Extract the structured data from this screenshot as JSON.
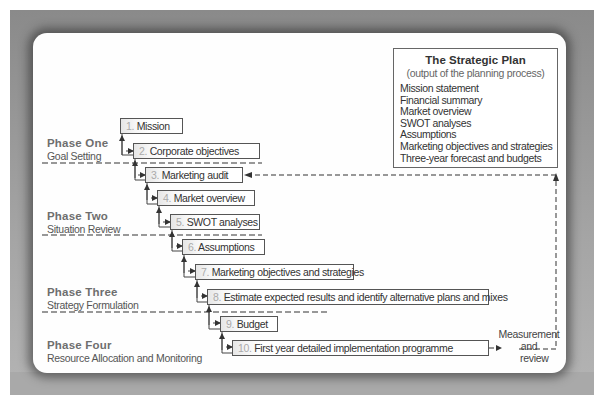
{
  "diagram": {
    "type": "flow-process",
    "steps": [
      {
        "num": "1.",
        "label": "Mission"
      },
      {
        "num": "2.",
        "label": "Corporate objectives"
      },
      {
        "num": "3.",
        "label": "Marketing audit"
      },
      {
        "num": "4.",
        "label": "Market overview"
      },
      {
        "num": "5.",
        "label": "SWOT analyses"
      },
      {
        "num": "6.",
        "label": "Assumptions"
      },
      {
        "num": "7.",
        "label": "Marketing objectives and strategies"
      },
      {
        "num": "8.",
        "label": "Estimate expected results and identify alternative plans and mixes"
      },
      {
        "num": "9.",
        "label": "Budget"
      },
      {
        "num": "10.",
        "label": "First year detailed implementation programme"
      }
    ],
    "phases": [
      {
        "title": "Phase One",
        "subtitle": "Goal Setting"
      },
      {
        "title": "Phase Two",
        "subtitle": "Situation Review"
      },
      {
        "title": "Phase Three",
        "subtitle": "Strategy Formulation"
      },
      {
        "title": "Phase Four",
        "subtitle": "Resource Allocation and Monitoring"
      }
    ],
    "strategic_plan": {
      "title": "The Strategic Plan",
      "subtitle": "(output of the planning process)",
      "items": [
        "Mission statement",
        "Financial summary",
        "Market overview",
        "SWOT analyses",
        "Assumptions",
        "Marketing objectives and strategies",
        "Three-year forecast and budgets"
      ]
    },
    "feedback": {
      "line1": "Measurement",
      "line2": "and",
      "line3": "review"
    }
  }
}
